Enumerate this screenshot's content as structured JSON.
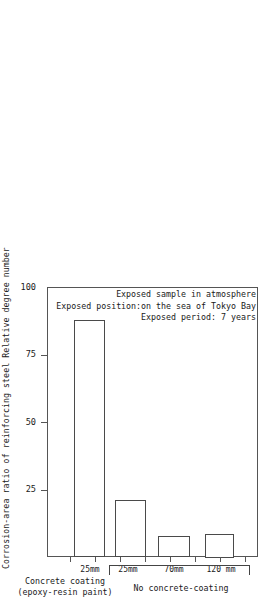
{
  "chart_data": {
    "type": "bar",
    "title": "",
    "xlabel": "",
    "ylabel": "Corrosion-area ratio of reinforcing steel  Relative degree number",
    "ylim": [
      0,
      100
    ],
    "yticks": [
      {
        "value": 100,
        "label": "100"
      },
      {
        "value": 75,
        "label": "75"
      },
      {
        "value": 50,
        "label": "50"
      },
      {
        "value": 25,
        "label": "25"
      }
    ],
    "grid": false,
    "legend": "none",
    "categories": [
      "25mm",
      "25mm",
      "70mm",
      "120 mm"
    ],
    "values": [
      4,
      88,
      21,
      8
    ],
    "bars": [
      {
        "label": "25mm",
        "value": 4,
        "group": "Concrete coating (epoxy-resin paint)"
      },
      {
        "label": "25mm",
        "value": 88,
        "group": "No concrete-coating"
      },
      {
        "label": "70mm",
        "value": 21,
        "group": "No concrete-coating"
      },
      {
        "label": "120 mm",
        "value": 8,
        "group": "No concrete-coating"
      }
    ],
    "groups": [
      {
        "name": "Concrete coating",
        "sub": "(epoxy-resin paint)"
      },
      {
        "name": "No concrete-coating",
        "sub": ""
      }
    ],
    "annotations": [
      "Exposed sample in atmosphere",
      "Exposed position:on the sea of Tokyo Bay",
      "Exposed period: 7 years"
    ],
    "colors": {
      "bar_fill": "#ffffff",
      "bar_edge": "#4a4a4a",
      "axis": "#555555",
      "text": "#1a1a1a"
    }
  }
}
